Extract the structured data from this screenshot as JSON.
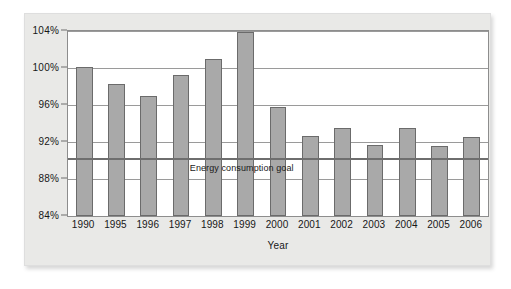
{
  "chart_data": {
    "type": "bar",
    "title": "",
    "xlabel": "Year",
    "ylabel": "",
    "categories": [
      "1990",
      "1995",
      "1996",
      "1997",
      "1998",
      "1999",
      "2000",
      "2001",
      "2002",
      "2003",
      "2004",
      "2005",
      "2006"
    ],
    "values": [
      100.1,
      98.3,
      97.0,
      99.2,
      101.0,
      103.9,
      95.8,
      92.6,
      93.5,
      91.7,
      93.5,
      91.6,
      92.5
    ],
    "ylim": [
      84,
      104
    ],
    "yticks": [
      84,
      88,
      92,
      96,
      100,
      104
    ],
    "ytick_labels": [
      "84%",
      "88%",
      "92%",
      "96%",
      "100%",
      "104%"
    ],
    "grid": true,
    "legend": "none",
    "annotations": [
      {
        "name": "energy-consumption-goal",
        "label": "Energy consumption goal",
        "type": "horizontal-line",
        "value": 90.3
      }
    ],
    "colors": {
      "bar_fill": "#a9a9a9",
      "bar_border": "#6b6b6b",
      "gridline": "#9a9a9a",
      "goal_line": "#6e6e6e",
      "plot_background": "#ffffff",
      "card_background": "#e9e9e7",
      "text": "#171717"
    }
  }
}
